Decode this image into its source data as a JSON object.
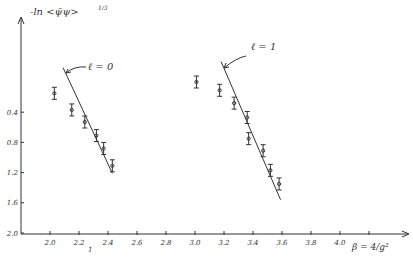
{
  "chart_data": {
    "type": "scatter",
    "title": "",
    "ylabel": "-ln <ψ̄ψ>^1/3",
    "xlabel": "β = 4/g²",
    "x_ticks": [
      "2.0",
      "2.2",
      "2.4",
      "2.6",
      "2.8",
      "3.0",
      "3.2",
      "3.4",
      "3.6",
      "3.8",
      "4.0",
      ""
    ],
    "y_ticks": [
      "0.4",
      "0.8",
      "1.2",
      "1.6",
      "2.0"
    ],
    "y_inverted": true,
    "xlim": [
      1.8,
      4.4
    ],
    "ylim": [
      0.0,
      2.0
    ],
    "grid": false,
    "below_axis_mark": "1",
    "series": [
      {
        "name": "ℓ = 0",
        "annotation": "ℓ = 0",
        "x": [
          2.03,
          2.15,
          2.24,
          2.32,
          2.37,
          2.43
        ],
        "y": [
          0.15,
          0.37,
          0.53,
          0.71,
          0.88,
          1.11
        ],
        "error_bars": true,
        "fit_line": {
          "x": [
            2.09,
            2.43
          ],
          "y": [
            -0.19,
            1.21
          ]
        }
      },
      {
        "name": "ℓ = 1",
        "annotation": "ℓ = 1",
        "x": [
          3.01,
          3.17,
          3.27,
          3.36,
          3.37,
          3.47,
          3.52,
          3.58
        ],
        "y": [
          0.0,
          0.11,
          0.28,
          0.47,
          0.75,
          0.91,
          1.17,
          1.35
        ],
        "error_bars": true,
        "fit_line": {
          "x": [
            3.18,
            3.59
          ],
          "y": [
            -0.27,
            1.56
          ]
        }
      }
    ]
  },
  "labels": {
    "ylabel_main": "-ln",
    "ylabel_bracket": "<ψ̄ψ>",
    "ylabel_exp": "1/3",
    "xlabel": "β = 4/g²",
    "l0": "ℓ = 0",
    "l1": "ℓ = 1",
    "mark": "1"
  }
}
